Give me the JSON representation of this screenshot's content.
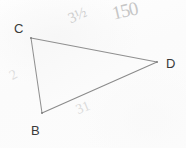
{
  "figure": {
    "type": "triangle",
    "fill_color": "#fafafa",
    "stroke_color": "#8a8a8a",
    "background_color": "#fcfcfc",
    "vertices": [
      {
        "label": "C",
        "x": 31,
        "y": 38
      },
      {
        "label": "D",
        "x": 157,
        "y": 62
      },
      {
        "label": "B",
        "x": 42,
        "y": 113
      }
    ],
    "edges": [
      {
        "name": "edge-cd",
        "from": "C",
        "to": "D"
      },
      {
        "name": "edge-db",
        "from": "D",
        "to": "B"
      },
      {
        "name": "edge-bc",
        "from": "B",
        "to": "C"
      }
    ]
  },
  "annotations": {
    "top_edge_note": "3½",
    "corner_note": "150",
    "left_edge_note": "2",
    "bottom_edge_note": "31"
  }
}
